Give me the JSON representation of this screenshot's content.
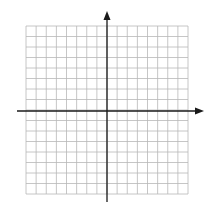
{
  "diagram": {
    "type": "coordinate-grid",
    "grid": {
      "left": 26,
      "top": 26,
      "right": 188,
      "bottom": 194,
      "columns": 16,
      "rows": 16,
      "line_color": "#b8b8b8"
    },
    "axes": {
      "color": "#1a1a1a",
      "origin": {
        "x": 107,
        "y": 111
      },
      "x_axis": {
        "from": 17,
        "to": 204,
        "arrow": "right"
      },
      "y_axis": {
        "from": 11,
        "to": 202,
        "arrow": "up"
      }
    }
  }
}
